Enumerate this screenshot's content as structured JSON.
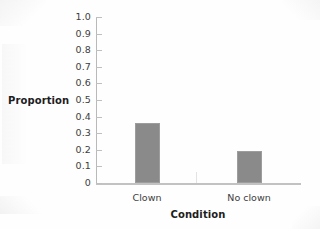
{
  "chart_data": {
    "type": "bar",
    "title": "",
    "subtitle": "",
    "xlabel": "Condition",
    "ylabel": "Proportion",
    "categories": [
      "Clown",
      "No clown"
    ],
    "values": [
      0.36,
      0.19
    ],
    "series": [
      {
        "name": "Proportion",
        "values": [
          0.36,
          0.19
        ]
      }
    ],
    "ylim": [
      0,
      1.0
    ],
    "ytick_values": [
      1.0,
      0.9,
      0.8,
      0.7,
      0.6,
      0.5,
      0.4,
      0.3,
      0.2,
      0.1,
      0
    ],
    "ytick_labels": [
      "1.0",
      "0.9",
      "0.8",
      "0.7",
      "0.6",
      "0.5",
      "0.4",
      "0.3",
      "0.2",
      "0.1",
      "0"
    ],
    "grid": false,
    "legend": null,
    "legend_position": "none",
    "annotations": [],
    "bar_color": "#8a8a8a",
    "bar_edge_color": "#9d9d9d",
    "axis_color": "#bfbfbf",
    "text_color": "#3d3d3d",
    "background_color": "#fefefe"
  }
}
